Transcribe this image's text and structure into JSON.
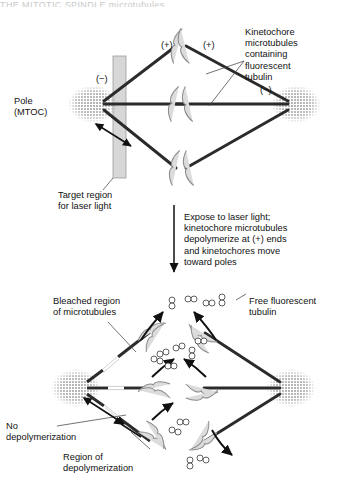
{
  "figure": {
    "title_strip": "THE MITOTIC SPINDLE     microtubules",
    "type": "biology-diagram"
  },
  "panels": {
    "top": {
      "name": "before-laser",
      "pole_label": "Pole\n(MTOC)",
      "plus_left": "(+)",
      "plus_right": "(+)",
      "minus_left": "(−)",
      "minus_right": "(−)",
      "target_label": "Target region\nfor laser light",
      "kinetochore_label": "Kinetochore\nmicrotubules\ncontaining\nfluorescent\ntubulin"
    },
    "transition": {
      "name": "laser-step",
      "text": "Expose to laser light;\nkinetochore microtubules\ndepolymerize at (+) ends\nand kinetochores move\ntoward poles"
    },
    "bottom": {
      "name": "after-laser",
      "bleached_label": "Bleached region\nof microtubules",
      "free_tubulin_label": "Free fluorescent\ntubulin",
      "no_depoly_label": "No\ndepolymerization",
      "region_depoly_label": "Region of\ndepolymerization"
    }
  },
  "colors": {
    "ink": "#111111",
    "microtubule": "#2b2b2b",
    "chromosome_fill": "#dcdcdc",
    "chromosome_stroke": "#8a8a8a",
    "laser_bar": "#d2d2d2",
    "pole_stipple": "#555555",
    "bleach_gap": "#ffffff"
  }
}
